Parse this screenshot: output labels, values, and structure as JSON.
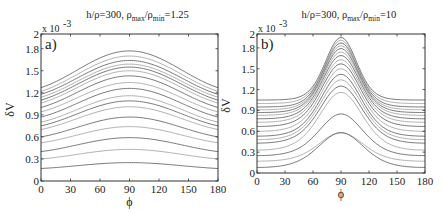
{
  "chart_data": [
    {
      "type": "line",
      "panel_label": "a)",
      "title": "h/ρ=300, ρ_max/ρ_min=1.25",
      "title_parts": {
        "base": "h/ρ=300, ρ",
        "sub1": "max",
        "mid": "/ρ",
        "sub2": "min",
        "tail": "=1.25"
      },
      "xlabel": "ϕ",
      "ylabel": "δV",
      "y_multiplier": "x 10",
      "y_multiplier_exp": "-3",
      "xlim": [
        0,
        180
      ],
      "ylim": [
        0,
        2
      ],
      "x_ticks": [
        0,
        30,
        60,
        90,
        120,
        150,
        180
      ],
      "x_tick_labels": [
        "0",
        "30",
        "60",
        "90",
        "120",
        "150",
        "180"
      ],
      "y_ticks": [
        0,
        0.3,
        0.6,
        0.9,
        1.2,
        1.5,
        1.8,
        2
      ],
      "y_tick_labels": [
        "0",
        "0.3",
        "0.6",
        "0.9",
        "1.2",
        "1.5",
        "1.8",
        "2"
      ],
      "shape": "broad",
      "series": [
        {
          "name": "c1",
          "edge": 1.27,
          "peak": 1.77
        },
        {
          "name": "c2",
          "edge": 1.22,
          "peak": 1.7
        },
        {
          "name": "c3",
          "edge": 1.18,
          "peak": 1.64
        },
        {
          "name": "c4",
          "edge": 1.14,
          "peak": 1.59
        },
        {
          "name": "c5",
          "edge": 1.1,
          "peak": 1.55
        },
        {
          "name": "c6",
          "edge": 1.06,
          "peak": 1.5
        },
        {
          "name": "c7",
          "edge": 1.0,
          "peak": 1.43
        },
        {
          "name": "c8",
          "edge": 0.94,
          "peak": 1.34
        },
        {
          "name": "c9",
          "edge": 0.87,
          "peak": 1.26
        },
        {
          "name": "c10",
          "edge": 0.8,
          "peak": 1.16
        },
        {
          "name": "c11",
          "edge": 0.75,
          "peak": 1.09
        },
        {
          "name": "c12",
          "edge": 0.7,
          "peak": 1.01
        },
        {
          "name": "c13",
          "edge": 0.6,
          "peak": 0.87
        },
        {
          "name": "c14",
          "edge": 0.52,
          "peak": 0.74
        },
        {
          "name": "c15",
          "edge": 0.4,
          "peak": 0.59
        },
        {
          "name": "c16",
          "edge": 0.3,
          "peak": 0.43
        },
        {
          "name": "c17",
          "edge": 0.17,
          "peak": 0.25
        }
      ]
    },
    {
      "type": "line",
      "panel_label": "b)",
      "title": "h/ρ=300, ρ_max/ρ_min=10",
      "title_parts": {
        "base": "h/ρ=300, ρ",
        "sub1": "max",
        "mid": "/ρ",
        "sub2": "min",
        "tail": "=10"
      },
      "xlabel": "ϕ",
      "ylabel": "δV",
      "y_multiplier": "x 10",
      "y_multiplier_exp": "-3",
      "xlim": [
        0,
        180
      ],
      "ylim": [
        0,
        2
      ],
      "x_ticks": [
        0,
        30,
        60,
        90,
        120,
        150,
        180
      ],
      "x_tick_labels": [
        "0",
        "30",
        "60",
        "90",
        "120",
        "150",
        "180"
      ],
      "y_ticks": [
        0,
        0.3,
        0.6,
        0.9,
        1.2,
        1.5,
        1.8,
        2
      ],
      "y_tick_labels": [
        "0",
        "0.3",
        "0.6",
        "0.9",
        "1.2",
        "1.5",
        "1.8",
        "2"
      ],
      "shape": "peaked",
      "series": [
        {
          "name": "c1",
          "edge": 1.05,
          "peak": 1.95
        },
        {
          "name": "c2",
          "edge": 1.0,
          "peak": 1.91
        },
        {
          "name": "c3",
          "edge": 0.95,
          "peak": 1.87
        },
        {
          "name": "c4",
          "edge": 0.91,
          "peak": 1.83
        },
        {
          "name": "c5",
          "edge": 0.87,
          "peak": 1.79
        },
        {
          "name": "c6",
          "edge": 0.83,
          "peak": 1.74
        },
        {
          "name": "c7",
          "edge": 0.78,
          "peak": 1.69
        },
        {
          "name": "c8",
          "edge": 0.73,
          "peak": 1.63
        },
        {
          "name": "c9",
          "edge": 0.67,
          "peak": 1.57
        },
        {
          "name": "c10",
          "edge": 0.6,
          "peak": 1.5
        },
        {
          "name": "c11",
          "edge": 0.53,
          "peak": 1.42
        },
        {
          "name": "c12",
          "edge": 0.48,
          "peak": 1.34
        },
        {
          "name": "c13",
          "edge": 0.43,
          "peak": 1.25
        },
        {
          "name": "c14",
          "edge": 0.33,
          "peak": 1.16
        },
        {
          "name": "c15",
          "edge": 0.25,
          "peak": 0.85
        },
        {
          "name": "c16",
          "edge": 0.17,
          "peak": 0.58
        },
        {
          "name": "c17",
          "edge": 0.08,
          "peak": 0.58
        }
      ]
    }
  ]
}
